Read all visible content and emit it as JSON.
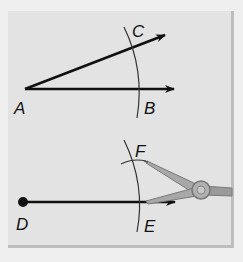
{
  "figure": {
    "top_construction": {
      "labels": {
        "vertex": "A",
        "point_on_ray_1": "C",
        "point_on_ray_2": "B"
      }
    },
    "bottom_construction": {
      "labels": {
        "endpoint": "D",
        "point_on_ray": "E",
        "arc_point": "F"
      },
      "tool": "compass"
    },
    "colors": {
      "panel": "#e3e3e3",
      "line": "#111111",
      "arc": "#333333",
      "compass": "#9a9a9a"
    }
  }
}
